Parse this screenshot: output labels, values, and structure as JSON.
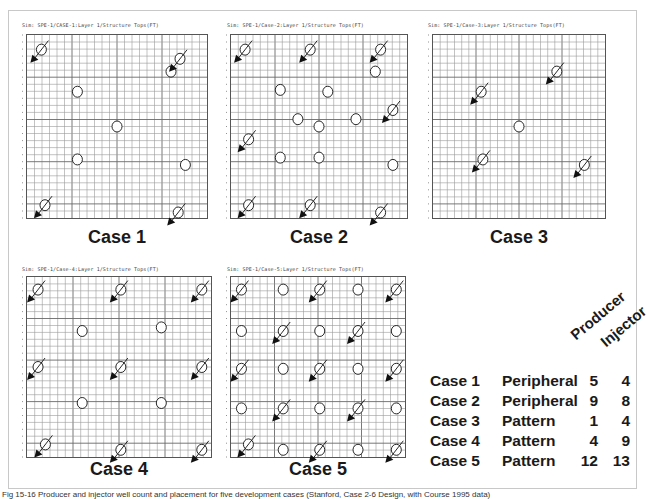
{
  "figure": {
    "caption": "Fig 15-16 Producer and injector well count and placement for five development cases (Stanford, Case 2-6 Design, with Course 1995 data)",
    "legend_marks": {
      "producer": "open-circle",
      "injector": "circle-with-diagonal-arrow"
    },
    "colors": {
      "grid": "#6a6a6a",
      "grid_minor": "#9a9a9a",
      "wells": "#111111",
      "border": "#c8c8c8"
    }
  },
  "panels": [
    {
      "id": "case1",
      "sim_title": "Sim: SPE-1/CASE-1:Layer  1/Structure Tops(FT)",
      "label": "Case 1",
      "producers": [
        [
          0.28,
          0.31
        ],
        [
          0.8,
          0.2
        ],
        [
          0.5,
          0.5
        ],
        [
          0.28,
          0.68
        ],
        [
          0.88,
          0.71
        ]
      ],
      "injectors": [
        [
          0.08,
          0.08
        ],
        [
          0.85,
          0.13
        ],
        [
          0.1,
          0.93
        ],
        [
          0.84,
          0.97
        ]
      ]
    },
    {
      "id": "case2",
      "sim_title": "Sim: SPE-1/Case-2:Layer  1/Structure Tops(FT)",
      "label": "Case 2",
      "producers": [
        [
          0.28,
          0.3
        ],
        [
          0.55,
          0.31
        ],
        [
          0.82,
          0.2
        ],
        [
          0.38,
          0.46
        ],
        [
          0.5,
          0.5
        ],
        [
          0.71,
          0.46
        ],
        [
          0.28,
          0.67
        ],
        [
          0.5,
          0.67
        ],
        [
          0.92,
          0.71
        ]
      ],
      "injectors": [
        [
          0.08,
          0.08
        ],
        [
          0.45,
          0.08
        ],
        [
          0.85,
          0.08
        ],
        [
          0.92,
          0.41
        ],
        [
          0.1,
          0.57
        ],
        [
          0.1,
          0.93
        ],
        [
          0.45,
          0.93
        ],
        [
          0.85,
          0.97
        ]
      ]
    },
    {
      "id": "case3",
      "sim_title": "Sim: SPE-1/Case-3:Layer  1/Structure Tops(FT)",
      "label": "Case 3",
      "producers": [
        [
          0.5,
          0.5
        ]
      ],
      "injectors": [
        [
          0.28,
          0.31
        ],
        [
          0.72,
          0.2
        ],
        [
          0.29,
          0.68
        ],
        [
          0.88,
          0.71
        ]
      ]
    },
    {
      "id": "case4",
      "sim_title": "Sim: SPE-1/Case-4:Layer  1/Structure Tops(FT)",
      "label": "Case 4",
      "producers": [
        [
          0.3,
          0.3
        ],
        [
          0.73,
          0.28
        ],
        [
          0.3,
          0.7
        ],
        [
          0.73,
          0.7
        ]
      ],
      "injectors": [
        [
          0.06,
          0.07
        ],
        [
          0.51,
          0.07
        ],
        [
          0.95,
          0.07
        ],
        [
          0.06,
          0.5
        ],
        [
          0.51,
          0.5
        ],
        [
          0.95,
          0.5
        ],
        [
          0.1,
          0.93
        ],
        [
          0.51,
          0.96
        ],
        [
          0.95,
          0.96
        ]
      ]
    },
    {
      "id": "case5",
      "sim_title": "Sim: SPE-1/Case-5:Layer  1/Structure Tops(FT)",
      "label": "Case 5",
      "producers": [
        [
          0.3,
          0.07
        ],
        [
          0.73,
          0.07
        ],
        [
          0.06,
          0.3
        ],
        [
          0.51,
          0.3
        ],
        [
          0.95,
          0.3
        ],
        [
          0.3,
          0.51
        ],
        [
          0.73,
          0.51
        ],
        [
          0.06,
          0.73
        ],
        [
          0.51,
          0.73
        ],
        [
          0.95,
          0.73
        ],
        [
          0.3,
          0.96
        ],
        [
          0.73,
          0.96
        ]
      ],
      "injectors": [
        [
          0.06,
          0.07
        ],
        [
          0.51,
          0.07
        ],
        [
          0.95,
          0.07
        ],
        [
          0.3,
          0.3
        ],
        [
          0.73,
          0.3
        ],
        [
          0.06,
          0.51
        ],
        [
          0.51,
          0.51
        ],
        [
          0.95,
          0.51
        ],
        [
          0.3,
          0.73
        ],
        [
          0.73,
          0.73
        ],
        [
          0.1,
          0.93
        ],
        [
          0.51,
          0.96
        ],
        [
          0.95,
          0.96
        ]
      ]
    }
  ],
  "summary_table": {
    "headers": {
      "case": "",
      "pattern": "",
      "producer": "Producer",
      "injector": "Injector"
    },
    "rows": [
      {
        "case": "Case 1",
        "pattern": "Peripheral",
        "producer": "5",
        "injector": "4"
      },
      {
        "case": "Case 2",
        "pattern": "Peripheral",
        "producer": "9",
        "injector": "8"
      },
      {
        "case": "Case 3",
        "pattern": "Pattern",
        "producer": "1",
        "injector": "4"
      },
      {
        "case": "Case 4",
        "pattern": "Pattern",
        "producer": "4",
        "injector": "9"
      },
      {
        "case": "Case 5",
        "pattern": "Pattern",
        "producer": "12",
        "injector": "13"
      }
    ]
  }
}
